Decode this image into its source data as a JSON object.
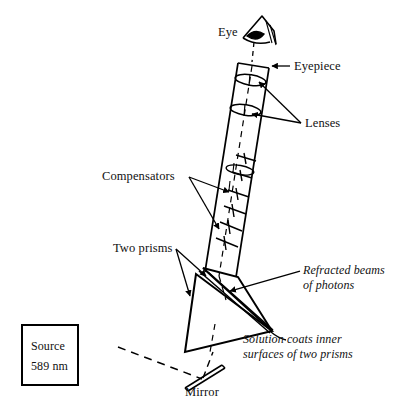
{
  "figure": {
    "title_absent": true,
    "background_color": "#ffffff",
    "ink_color": "#000000",
    "type": "optical-instrument-schematic"
  },
  "labels": {
    "eye": "Eye",
    "eyepiece": "Eyepiece",
    "lenses": "Lenses",
    "compensators": "Compensators",
    "two_prisms": "Two prisms",
    "refracted_beams_line1": "Refracted beams",
    "refracted_beams_line2": "of photons",
    "solution_line1": "Solution coats inner",
    "solution_line2": "surfaces of two prisms",
    "mirror": "Mirror"
  },
  "source_box": {
    "line1": "Source",
    "line2": "589 nm"
  },
  "components": {
    "eye_icon": "eye-icon",
    "eyepiece_icon": "eyepiece-aperture",
    "lens_count": 2,
    "compensator_count": 5,
    "prism_count": 2,
    "mirror_icon": "mirror-bar",
    "beam_style": "dashed",
    "optical_axis_style": "dashed"
  },
  "colors": {
    "ink": "#000000",
    "background": "#ffffff"
  }
}
